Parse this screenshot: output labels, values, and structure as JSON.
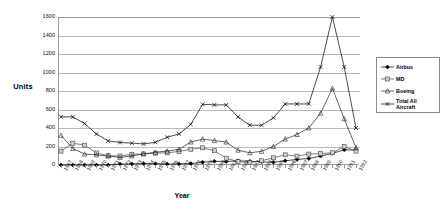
{
  "chart_data": {
    "type": "line",
    "title": "",
    "xlabel": "Year",
    "ylabel": "Units",
    "ylim": [
      0,
      1600
    ],
    "ytick_step": 200,
    "yticks": [
      0,
      200,
      400,
      600,
      800,
      1000,
      1200,
      1400,
      1600
    ],
    "grid": true,
    "legend_position": "right",
    "x": [
      "1967",
      "1968",
      "1969",
      "1970",
      "1971",
      "1972",
      "1973",
      "1974",
      "1975",
      "1976",
      "1977",
      "1978",
      "1979",
      "1980",
      "1981",
      "1982",
      "1983",
      "1984",
      "1985",
      "1986",
      "1987",
      "1988",
      "1989",
      "1990",
      "1991",
      "1992"
    ],
    "series": [
      {
        "name": "Airbus",
        "marker": "diamond",
        "color": "#000000",
        "values": [
          0,
          0,
          0,
          0,
          0,
          10,
          12,
          16,
          14,
          10,
          12,
          16,
          30,
          40,
          38,
          46,
          40,
          34,
          30,
          46,
          60,
          70,
          96,
          126,
          164,
          160
        ]
      },
      {
        "name": "MD",
        "marker": "square",
        "color": "#444444",
        "values": [
          150,
          236,
          214,
          130,
          100,
          98,
          116,
          120,
          128,
          132,
          146,
          170,
          186,
          154,
          74,
          36,
          26,
          46,
          78,
          110,
          96,
          118,
          124,
          132,
          200,
          150
        ]
      },
      {
        "name": "Boeing",
        "marker": "triangle",
        "color": "#222222",
        "values": [
          320,
          178,
          118,
          110,
          96,
          82,
          98,
          120,
          138,
          150,
          170,
          248,
          280,
          264,
          248,
          160,
          132,
          148,
          200,
          280,
          330,
          400,
          560,
          830,
          500,
          186
        ]
      },
      {
        "name": "Total All Aircraft",
        "marker": "x",
        "color": "#000000",
        "values": [
          520,
          520,
          448,
          336,
          260,
          244,
          236,
          228,
          246,
          300,
          336,
          440,
          656,
          650,
          650,
          520,
          430,
          430,
          510,
          660,
          660,
          660,
          1060,
          1600,
          1060,
          400
        ]
      }
    ]
  },
  "legend": {
    "items": [
      {
        "label": "Airbus"
      },
      {
        "label": "MD"
      },
      {
        "label": "Boeing"
      },
      {
        "label": "Total All Aircraft"
      }
    ]
  }
}
